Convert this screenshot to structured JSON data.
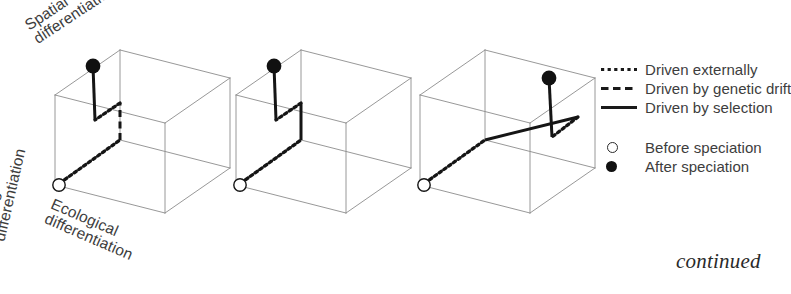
{
  "figure": {
    "type": "diagram",
    "continued_note": "continued"
  },
  "axes": {
    "spatial": "Spatial\ndifferentiation",
    "mating": "Mating\ndifferentiation",
    "ecological": "Ecological\ndifferentiation"
  },
  "legend": {
    "lines": [
      {
        "style": "dotted",
        "label": "Driven externally"
      },
      {
        "style": "dashed",
        "label": "Driven by genetic drift"
      },
      {
        "style": "solid",
        "label": "Driven by selection"
      }
    ],
    "markers": [
      {
        "style": "open",
        "label": "Before speciation"
      },
      {
        "style": "filled",
        "label": "After speciation"
      }
    ]
  },
  "colors": {
    "cube_stroke": "#8c8c8c",
    "path_stroke": "#151515",
    "text": "#3d3d3d",
    "marker_fill": "#111111",
    "marker_open_fill": "#ffffff",
    "background": "#ffffff"
  },
  "panels": [
    {
      "id": "panel-1",
      "origin_x": 55,
      "cube": {
        "front_bottom_left": [
          55,
          185
        ],
        "front_bottom_right": [
          165,
          213
        ],
        "front_top_left": [
          55,
          95
        ],
        "front_top_right": [
          165,
          123
        ],
        "back_bottom_left": [
          120,
          140
        ],
        "back_bottom_right": [
          230,
          168
        ],
        "back_top_left": [
          120,
          50
        ],
        "back_top_right": [
          230,
          78
        ]
      },
      "trajectory": [
        {
          "from": [
            60,
            183
          ],
          "to": [
            120,
            140
          ],
          "style": "dotted"
        },
        {
          "from": [
            120,
            140
          ],
          "to": [
            120,
            103
          ],
          "style": "dashed"
        },
        {
          "from": [
            120,
            103
          ],
          "to": [
            95,
            120
          ],
          "style": "dotted"
        },
        {
          "from": [
            95,
            120
          ],
          "to": [
            93,
            66
          ],
          "style": "solid"
        }
      ],
      "start_marker": [
        59,
        185
      ],
      "end_marker": [
        93,
        66
      ]
    },
    {
      "id": "panel-2",
      "origin_x": 236,
      "cube": {
        "front_bottom_left": [
          236,
          185
        ],
        "front_bottom_right": [
          346,
          213
        ],
        "front_top_left": [
          236,
          95
        ],
        "front_top_right": [
          346,
          123
        ],
        "back_bottom_left": [
          301,
          140
        ],
        "back_bottom_right": [
          411,
          168
        ],
        "back_top_left": [
          301,
          50
        ],
        "back_top_right": [
          411,
          78
        ]
      },
      "trajectory": [
        {
          "from": [
            241,
            183
          ],
          "to": [
            301,
            140
          ],
          "style": "dotted"
        },
        {
          "from": [
            301,
            140
          ],
          "to": [
            301,
            103
          ],
          "style": "solid"
        },
        {
          "from": [
            301,
            103
          ],
          "to": [
            276,
            120
          ],
          "style": "dotted"
        },
        {
          "from": [
            276,
            120
          ],
          "to": [
            274,
            66
          ],
          "style": "solid"
        }
      ],
      "start_marker": [
        240,
        185
      ],
      "end_marker": [
        274,
        66
      ]
    },
    {
      "id": "panel-3",
      "origin_x": 420,
      "cube": {
        "front_bottom_left": [
          420,
          185
        ],
        "front_bottom_right": [
          530,
          213
        ],
        "front_top_left": [
          420,
          95
        ],
        "front_top_right": [
          530,
          123
        ],
        "back_bottom_left": [
          485,
          140
        ],
        "back_bottom_right": [
          595,
          168
        ],
        "back_top_left": [
          485,
          50
        ],
        "back_top_right": [
          595,
          78
        ]
      },
      "trajectory": [
        {
          "from": [
            425,
            183
          ],
          "to": [
            485,
            140
          ],
          "style": "dotted"
        },
        {
          "from": [
            485,
            140
          ],
          "to": [
            578,
            117
          ],
          "style": "solid"
        },
        {
          "from": [
            578,
            117
          ],
          "to": [
            552,
            137
          ],
          "style": "dotted"
        },
        {
          "from": [
            552,
            137
          ],
          "to": [
            549,
            78
          ],
          "style": "solid"
        }
      ],
      "start_marker": [
        424,
        185
      ],
      "end_marker": [
        549,
        78
      ]
    }
  ]
}
